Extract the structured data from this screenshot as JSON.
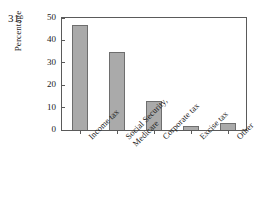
{
  "problem": {
    "number": "31."
  },
  "chart_data": {
    "type": "bar",
    "title": "",
    "xlabel": "",
    "ylabel": "Percentage",
    "categories": [
      "Income tax",
      "Social Security, Medicare",
      "Corporate tax",
      "Excise tax",
      "Other"
    ],
    "category_lines": [
      [
        "Income tax"
      ],
      [
        "Social Security,",
        "Medicare"
      ],
      [
        "Corporate tax"
      ],
      [
        "Excise tax"
      ],
      [
        "Other"
      ]
    ],
    "values": [
      47,
      35,
      13,
      2,
      3
    ],
    "ylim": [
      0,
      50
    ],
    "yticks": [
      0,
      10,
      20,
      30,
      40,
      50
    ],
    "ytick_labels": [
      "0",
      "10",
      "20",
      "30",
      "40",
      "50"
    ],
    "grid": false,
    "legend": false,
    "bar_color": "#aaaaaa",
    "bar_edge_color": "#6e6e6e",
    "axis_color": "#5a5a5a"
  }
}
